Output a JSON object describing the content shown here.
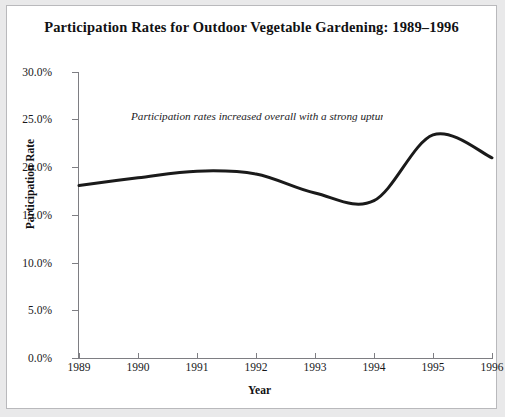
{
  "chart_data": {
    "type": "line",
    "title": "Participation Rates for Outdoor Vegetable Gardening: 1989–1996",
    "xlabel": "Year",
    "ylabel": "Participation Rate",
    "categories": [
      "1989",
      "1990",
      "1991",
      "1992",
      "1993",
      "1994",
      "1995",
      "1996"
    ],
    "x": [
      1989,
      1990,
      1991,
      1992,
      1993,
      1994,
      1995,
      1996
    ],
    "values": [
      18.1,
      18.9,
      19.6,
      19.3,
      17.3,
      16.5,
      23.4,
      21.0
    ],
    "series": [
      {
        "name": "Participation Rate",
        "values": [
          18.1,
          18.9,
          19.6,
          19.3,
          17.3,
          16.5,
          23.4,
          21.0
        ]
      }
    ],
    "ylim": [
      0.0,
      30.0
    ],
    "xlim": [
      1989,
      1996
    ],
    "ytick_values": [
      0.0,
      5.0,
      10.0,
      15.0,
      20.0,
      25.0,
      30.0
    ],
    "ytick_labels": [
      "0.0%",
      "5.0%",
      "10.0%",
      "15.0%",
      "20.0%",
      "25.0%",
      "30.0%"
    ],
    "xtick_labels": [
      "1989",
      "1990",
      "1991",
      "1992",
      "1993",
      "1994",
      "1995",
      "1996"
    ],
    "grid": false,
    "legend": null,
    "legend_position": "none",
    "line_color": "#1a1a1a",
    "line_width": 3,
    "smoothed": true,
    "annotations": [
      {
        "text": "Participation rates increased overall with a strong upturn in rate in 1995",
        "style": "italic",
        "clipped": true
      }
    ]
  },
  "axes": {
    "y_ticks": [
      {
        "label": "30.0%",
        "value": 30.0
      },
      {
        "label": "25.0%",
        "value": 25.0
      },
      {
        "label": "20.0%",
        "value": 20.0
      },
      {
        "label": "15.0%",
        "value": 15.0
      },
      {
        "label": "10.0%",
        "value": 10.0
      },
      {
        "label": "5.0%",
        "value": 5.0
      },
      {
        "label": "0.0%",
        "value": 0.0
      }
    ],
    "x_ticks": [
      {
        "label": "1989"
      },
      {
        "label": "1990"
      },
      {
        "label": "1991"
      },
      {
        "label": "1992"
      },
      {
        "label": "1993"
      },
      {
        "label": "1994"
      },
      {
        "label": "1995"
      },
      {
        "label": "1996"
      }
    ]
  },
  "colors": {
    "figure_background": "#ffffff",
    "page_background": "#e9e9ea",
    "axis": "#7e7e83",
    "text": "#111113",
    "line": "#1a1a1a"
  }
}
